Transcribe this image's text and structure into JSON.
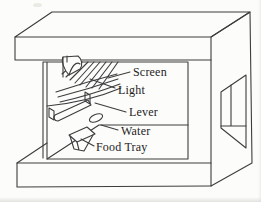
{
  "diagram": {
    "labels": {
      "screen": "Screen",
      "light": "Light",
      "lever": "Lever",
      "water": "Water",
      "food_tray": "Food Tray"
    },
    "colors": {
      "line": "#3d3d3d",
      "text": "#1c1c1c",
      "background": "#fcfcfb"
    }
  }
}
